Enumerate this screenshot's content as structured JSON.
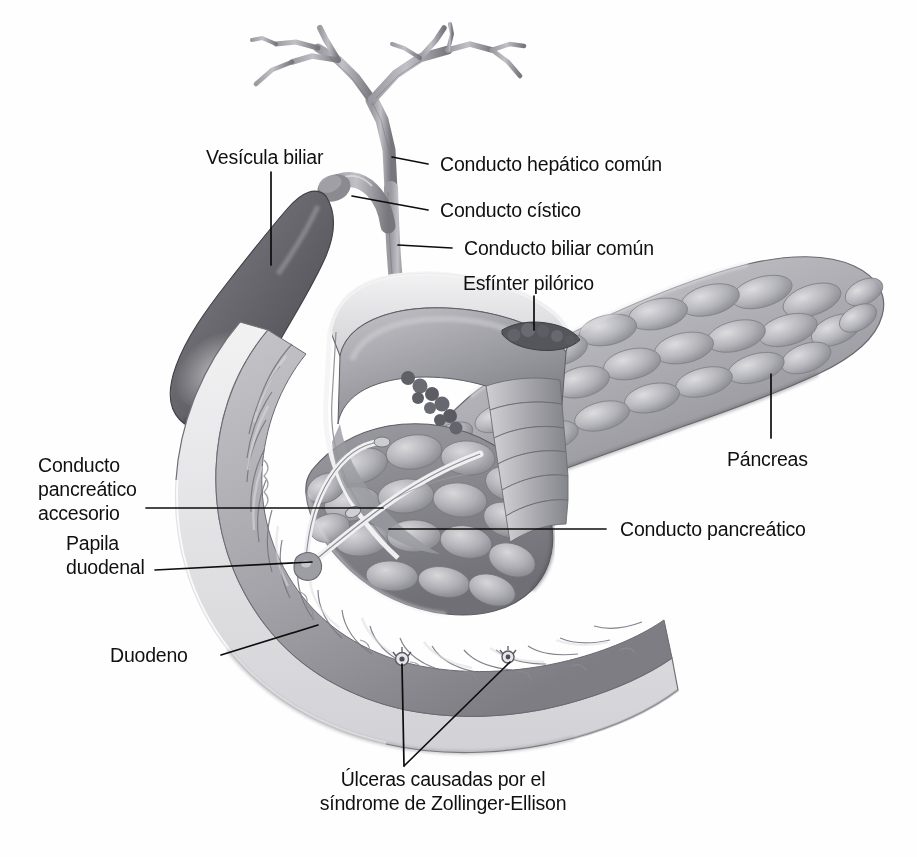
{
  "figure": {
    "language": "es",
    "background_color": "#fefefe",
    "ink_color": "#101010"
  },
  "labels": [
    {
      "id": "gallbladder",
      "text": "Vesícula biliar",
      "align": "start"
    },
    {
      "id": "common-hepatic-duct",
      "text": "Conducto hepático común",
      "align": "start"
    },
    {
      "id": "cystic-duct",
      "text": "Conducto cístico",
      "align": "start"
    },
    {
      "id": "common-bile-duct",
      "text": "Conducto biliar común",
      "align": "start"
    },
    {
      "id": "pyloric-sphincter",
      "text": "Esfínter pilórico",
      "align": "start"
    },
    {
      "id": "pancreas",
      "text": "Páncreas",
      "align": "start"
    },
    {
      "id": "accessory-duct-l1",
      "text": "Conducto",
      "align": "start"
    },
    {
      "id": "accessory-duct-l2",
      "text": "pancreático",
      "align": "start"
    },
    {
      "id": "accessory-duct-l3",
      "text": "accesorio",
      "align": "start"
    },
    {
      "id": "pancreatic-duct",
      "text": "Conducto pancreático",
      "align": "start"
    },
    {
      "id": "papilla-l1",
      "text": "Papila",
      "align": "start"
    },
    {
      "id": "papilla-l2",
      "text": "duodenal",
      "align": "start"
    },
    {
      "id": "duodenum",
      "text": "Duodeno",
      "align": "start"
    },
    {
      "id": "ulcers-l1",
      "text": "Úlceras causadas por el",
      "align": "middle"
    },
    {
      "id": "ulcers-l2",
      "text": "síndrome de Zollinger-Ellison",
      "align": "middle"
    }
  ],
  "structures": [
    {
      "id": "biliary-tree",
      "name": "Árbol biliar hepático"
    },
    {
      "id": "gallbladder-body",
      "name": "Vesícula biliar"
    },
    {
      "id": "cystic-duct-tube",
      "name": "Conducto cístico"
    },
    {
      "id": "common-bile-duct-tube",
      "name": "Conducto biliar común"
    },
    {
      "id": "stomach-antrum",
      "name": "Antro gástrico seccionado"
    },
    {
      "id": "pyloric-sphincter-ring",
      "name": "Esfínter pilórico"
    },
    {
      "id": "duodenum-loop",
      "name": "Asa duodenal (sección)"
    },
    {
      "id": "duodenal-folds",
      "name": "Pliegues circulares del duodeno"
    },
    {
      "id": "duodenal-papilla",
      "name": "Papila duodenal mayor"
    },
    {
      "id": "pancreas-body",
      "name": "Páncreas (cabeza, cuerpo y cola)"
    },
    {
      "id": "pancreatic-duct-line",
      "name": "Conducto pancreático principal"
    },
    {
      "id": "accessory-pancreatic-duct",
      "name": "Conducto pancreático accesorio"
    },
    {
      "id": "ulcer-1",
      "name": "Úlcera duodenal 1"
    },
    {
      "id": "ulcer-2",
      "name": "Úlcera duodenal 2"
    }
  ]
}
